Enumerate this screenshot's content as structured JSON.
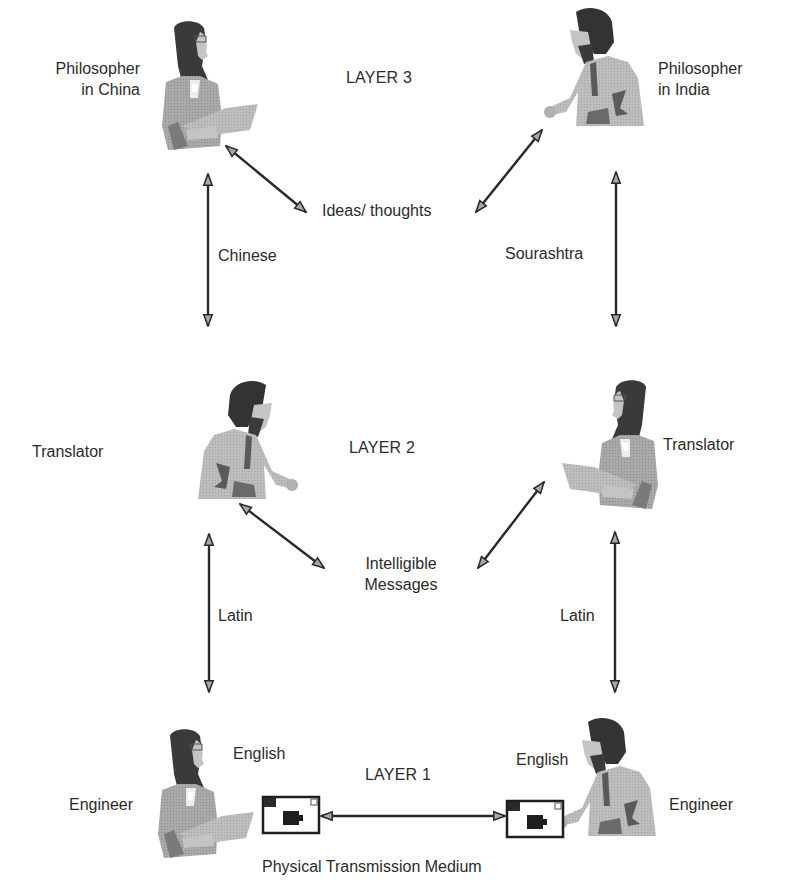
{
  "layers": {
    "layer3": {
      "title": "LAYER 3",
      "left_actor": {
        "name_line1": "Philosopher",
        "name_line2": "in China"
      },
      "right_actor": {
        "name_line1": "Philosopher",
        "name_line2": "in India"
      },
      "peer_label": "Ideas/ thoughts"
    },
    "layer2": {
      "title": "LAYER 2",
      "left_actor": {
        "name": "Translator"
      },
      "right_actor": {
        "name": "Translator"
      },
      "peer_label_line1": "Intelligible",
      "peer_label_line2": "Messages"
    },
    "layer1": {
      "title": "LAYER 1",
      "left_actor": {
        "name": "Engineer",
        "language": "English"
      },
      "right_actor": {
        "name": "Engineer",
        "language": "English"
      },
      "medium_label": "Physical Transmission Medium"
    }
  },
  "interfaces": {
    "left_3_2": "Chinese",
    "right_3_2": "Sourashtra",
    "left_2_1": "Latin",
    "right_2_1": "Latin"
  },
  "colors": {
    "arrow_stroke": "#2a2a2a",
    "arrow_fill": "#a8a8a8",
    "figure_hair": "#3a3a3a",
    "figure_suit_dark": "#8c8c8c",
    "figure_suit_light": "#b4b4b4",
    "figure_skin": "#c8c8c8"
  }
}
